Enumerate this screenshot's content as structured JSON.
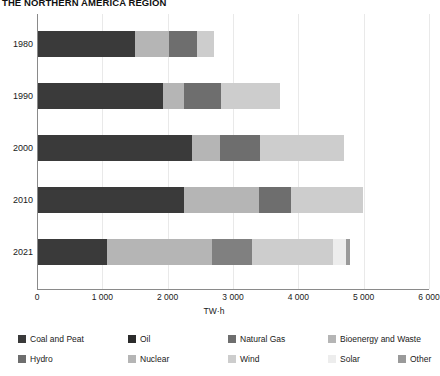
{
  "chart_data": {
    "type": "bar",
    "orientation": "horizontal",
    "stacked": true,
    "title": "THE NORTHERN AMERICA REGION",
    "xlabel": "TW·h",
    "ylabel": "",
    "xlim": [
      0,
      6000
    ],
    "xticks": [
      0,
      1000,
      2000,
      3000,
      4000,
      5000,
      6000
    ],
    "xticklabels": [
      "0",
      "1 000",
      "2 000",
      "3 000",
      "4 000",
      "5 000",
      "6 000"
    ],
    "grid": true,
    "legend_position": "bottom",
    "categories": [
      "1980",
      "1990",
      "2000",
      "2010",
      "2021"
    ],
    "series": [
      {
        "name": "Coal and Peat",
        "color": "#3a3a3a",
        "values": [
          1490,
          1910,
          2360,
          2240,
          1060
        ]
      },
      {
        "name": "Oil",
        "color": "#2b2b2b",
        "values": [
          0,
          0,
          0,
          0,
          0
        ]
      },
      {
        "name": "Natural Gas",
        "color": "#6e6e6e",
        "values": [
          0,
          0,
          0,
          0,
          0
        ]
      },
      {
        "name": "Bioenergy and Waste",
        "color": "#b5b5b5",
        "values": [
          510,
          320,
          430,
          1150,
          1610
        ]
      },
      {
        "name": "Hydro",
        "color": "#6e6e6e",
        "values": [
          440,
          570,
          610,
          480,
          0
        ]
      },
      {
        "name": "Nuclear",
        "color": "#808080",
        "values": [
          0,
          0,
          0,
          0,
          600
        ]
      },
      {
        "name": "Wind",
        "color": "#cdcdcd",
        "values": [
          260,
          900,
          1290,
          1100,
          1240
        ]
      },
      {
        "name": "Solar",
        "color": "#ededed",
        "values": [
          0,
          0,
          0,
          0,
          200
        ]
      },
      {
        "name": "Other",
        "color": "#9a9a9a",
        "values": [
          0,
          0,
          0,
          0,
          60
        ]
      }
    ],
    "totals": [
      2700,
      3700,
      4690,
      4970,
      4770
    ],
    "bar_segments": [
      {
        "category": "1980",
        "segments": [
          {
            "label": "Coal and Peat",
            "color": "#3a3a3a",
            "start": 0,
            "end": 1490
          },
          {
            "label": "Bioenergy and Waste",
            "color": "#b5b5b5",
            "start": 1490,
            "end": 2000
          },
          {
            "label": "Hydro",
            "color": "#6e6e6e",
            "start": 2000,
            "end": 2440
          },
          {
            "label": "Wind",
            "color": "#cdcdcd",
            "start": 2440,
            "end": 2700
          }
        ]
      },
      {
        "category": "1990",
        "segments": [
          {
            "label": "Coal and Peat",
            "color": "#3a3a3a",
            "start": 0,
            "end": 1910
          },
          {
            "label": "Bioenergy and Waste",
            "color": "#b5b5b5",
            "start": 1910,
            "end": 2230
          },
          {
            "label": "Hydro",
            "color": "#6e6e6e",
            "start": 2230,
            "end": 2800
          },
          {
            "label": "Wind",
            "color": "#cdcdcd",
            "start": 2800,
            "end": 3700
          }
        ]
      },
      {
        "category": "2000",
        "segments": [
          {
            "label": "Coal and Peat",
            "color": "#3a3a3a",
            "start": 0,
            "end": 2360
          },
          {
            "label": "Bioenergy and Waste",
            "color": "#b5b5b5",
            "start": 2360,
            "end": 2790
          },
          {
            "label": "Hydro",
            "color": "#6e6e6e",
            "start": 2790,
            "end": 3400
          },
          {
            "label": "Wind",
            "color": "#cdcdcd",
            "start": 3400,
            "end": 4690
          }
        ]
      },
      {
        "category": "2010",
        "segments": [
          {
            "label": "Coal and Peat",
            "color": "#3a3a3a",
            "start": 0,
            "end": 2240
          },
          {
            "label": "Bioenergy and Waste",
            "color": "#b5b5b5",
            "start": 2240,
            "end": 3390
          },
          {
            "label": "Hydro",
            "color": "#6e6e6e",
            "start": 3390,
            "end": 3870
          },
          {
            "label": "Wind",
            "color": "#cdcdcd",
            "start": 3870,
            "end": 4970
          }
        ]
      },
      {
        "category": "2021",
        "segments": [
          {
            "label": "Coal and Peat",
            "color": "#3a3a3a",
            "start": 0,
            "end": 1060
          },
          {
            "label": "Bioenergy and Waste",
            "color": "#b5b5b5",
            "start": 1060,
            "end": 2670
          },
          {
            "label": "Nuclear",
            "color": "#808080",
            "start": 2670,
            "end": 3270
          },
          {
            "label": "Wind",
            "color": "#cdcdcd",
            "start": 3270,
            "end": 4510
          },
          {
            "label": "Solar",
            "color": "#ededed",
            "start": 4510,
            "end": 4710
          },
          {
            "label": "Other",
            "color": "#9a9a9a",
            "start": 4710,
            "end": 4770
          }
        ]
      }
    ],
    "legend": [
      {
        "label": "Coal and Peat",
        "color": "#3a3a3a"
      },
      {
        "label": "Oil",
        "color": "#2b2b2b"
      },
      {
        "label": "Natural Gas",
        "color": "#6e6e6e"
      },
      {
        "label": "Bioenergy and Waste",
        "color": "#b5b5b5"
      },
      {
        "label": "Hydro",
        "color": "#6e6e6e"
      },
      {
        "label": "Nuclear",
        "color": "#b5b5b5"
      },
      {
        "label": "Wind",
        "color": "#cdcdcd"
      },
      {
        "label": "Solar",
        "color": "#ededed"
      },
      {
        "label": "Other",
        "color": "#9a9a9a"
      }
    ]
  }
}
